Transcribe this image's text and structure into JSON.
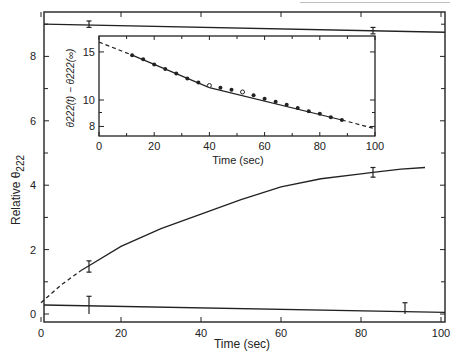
{
  "chart_data": [
    {
      "id": "main",
      "type": "line",
      "title": "",
      "xlabel": "Time (sec)",
      "ylabel": "Relative θ222",
      "xlim": [
        0,
        100
      ],
      "ylim": [
        0,
        9.5
      ],
      "x_ticks": [
        0,
        20,
        40,
        60,
        80,
        100
      ],
      "y_ticks": [
        0,
        2,
        4,
        6,
        8
      ],
      "y_minor_ticks": [
        1,
        3,
        5,
        7,
        9
      ],
      "grid": false,
      "series": [
        {
          "name": "growth curve",
          "style": "solid (dashed for t < 7)",
          "x": [
            0,
            5,
            10,
            12,
            20,
            30,
            40,
            50,
            60,
            70,
            80,
            83,
            90,
            96
          ],
          "values": [
            0.35,
            0.9,
            1.35,
            1.5,
            2.1,
            2.65,
            3.1,
            3.55,
            3.95,
            4.2,
            4.35,
            4.4,
            4.5,
            4.55
          ]
        },
        {
          "name": "upper baseline",
          "style": "solid",
          "x": [
            0,
            100
          ],
          "values": [
            9.0,
            8.75
          ]
        },
        {
          "name": "lower baseline",
          "style": "solid",
          "x": [
            0,
            100
          ],
          "values": [
            0.28,
            0.05
          ]
        }
      ],
      "error_bars": [
        {
          "x": 12,
          "y": 1.5,
          "low": 1.3,
          "high": 1.65
        },
        {
          "x": 83,
          "y": 4.4,
          "low": 4.25,
          "high": 4.55
        },
        {
          "x": 12,
          "y": 0.0,
          "low": 0.0,
          "high": 0.55,
          "on": "lower baseline"
        },
        {
          "x": 91,
          "y": 0.0,
          "low": 0.0,
          "high": 0.35,
          "on": "lower baseline"
        },
        {
          "x": 12,
          "y": 9.0,
          "low": 8.9,
          "high": 9.1,
          "on": "upper baseline"
        },
        {
          "x": 83,
          "y": 8.8,
          "low": 8.7,
          "high": 8.9,
          "on": "upper baseline"
        }
      ]
    },
    {
      "id": "inset",
      "type": "scatter",
      "title": "",
      "xlabel": "Time (sec)",
      "ylabel": "θ222(t) − θ222(∞)",
      "yscale": "log",
      "xlim": [
        0,
        100
      ],
      "ylim": [
        7.5,
        17
      ],
      "x_ticks": [
        0,
        20,
        40,
        60,
        80,
        100
      ],
      "y_ticks": [
        8,
        10,
        15
      ],
      "y_minor_ticks": [
        9
      ],
      "grid": false,
      "series": [
        {
          "name": "measured (filled)",
          "marker": "filled circle",
          "x": [
            12,
            16,
            20,
            24,
            28,
            32,
            36,
            44,
            48,
            56,
            60,
            64,
            68,
            72,
            76,
            80,
            84,
            88
          ],
          "values": [
            14.6,
            14.1,
            13.5,
            13.0,
            12.5,
            12.0,
            11.6,
            11.1,
            10.9,
            10.4,
            10.1,
            9.85,
            9.6,
            9.35,
            9.1,
            8.9,
            8.65,
            8.45
          ]
        },
        {
          "name": "measured (open)",
          "marker": "open circle",
          "x": [
            40,
            52
          ],
          "values": [
            11.3,
            10.7
          ]
        },
        {
          "name": "fit",
          "style": "solid (dashed extrapolation t<12 and t>88)",
          "x": [
            0,
            12,
            40,
            88,
            100
          ],
          "values": [
            16.3,
            14.6,
            11.1,
            8.45,
            7.85
          ]
        }
      ]
    }
  ],
  "labels": {
    "main_xlabel": "Time (sec)",
    "main_ylabel_prefix": "Relative θ",
    "main_ylabel_sub": "222",
    "inset_xlabel": "Time (sec)",
    "inset_ylabel": "θ222(t) − θ222(∞)"
  }
}
